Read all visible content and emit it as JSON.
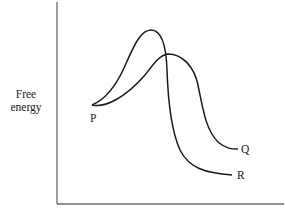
{
  "diagram": {
    "type": "energy-profile",
    "ylabel": {
      "line1": "Free",
      "line2": "energy"
    },
    "xlabel": "",
    "points": {
      "start": "P",
      "product_q": "Q",
      "product_r": "R"
    },
    "curves": [
      {
        "name": "P to Q",
        "description": "lower, broader activation barrier; ends at higher free energy than R"
      },
      {
        "name": "P to R",
        "description": "higher, sharper activation barrier; ends at lowest free energy"
      }
    ],
    "colors": {
      "line": "#1a1a1a",
      "axis": "#6b6b6b",
      "background": "#ffffff"
    }
  }
}
